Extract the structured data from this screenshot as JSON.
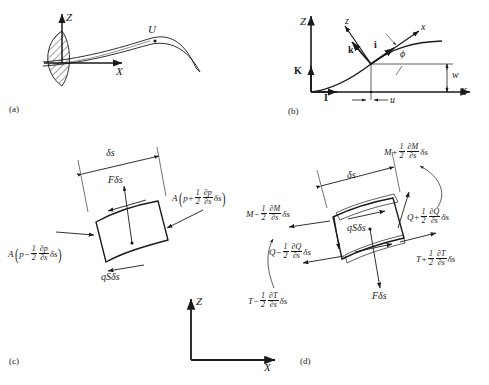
{
  "figure": {
    "type": "engineering-diagram",
    "panels": [
      {
        "tag": "(a)",
        "name": "blade-geometry"
      },
      {
        "tag": "(b)",
        "name": "coordinate-systems"
      },
      {
        "tag": "(c)",
        "name": "pressure-element"
      },
      {
        "tag": "(d)",
        "name": "moment-shear-element"
      }
    ]
  },
  "panel_a": {
    "tag": "(a)",
    "axis_z": "Z",
    "axis_x": "X",
    "velocity": "U"
  },
  "panel_b": {
    "tag": "(b)",
    "axis_Z": "Z",
    "axis_X": "X",
    "unit_K": "K",
    "unit_I": "I",
    "unit_k": "k",
    "unit_i": "i",
    "local_z": "z",
    "local_x": "x",
    "angle_phi": "ϕ",
    "disp_w": "w",
    "disp_u": "u"
  },
  "panel_c": {
    "tag": "(c)",
    "ds": "δs",
    "force_F": "Fδs",
    "force_qS": "qSδs",
    "pressure_plus": {
      "prefix": "A",
      "open": "(",
      "var": "p",
      "sign": "+",
      "frac_num": "1",
      "frac_den": "2",
      "deriv_num": "∂p",
      "deriv_den": "∂s",
      "suffix": "δs",
      "close": ")"
    },
    "pressure_minus": {
      "prefix": "A",
      "open": "(",
      "var": "p",
      "sign": "−",
      "frac_num": "1",
      "frac_den": "2",
      "deriv_num": "∂p",
      "deriv_den": "∂s",
      "suffix": "δs",
      "close": ")"
    }
  },
  "panel_d": {
    "tag": "(d)",
    "ds": "δs",
    "force_F": "Fδs",
    "force_qS": "qSδs",
    "moment_plus": {
      "var": "M",
      "sign": "+",
      "frac_num": "1",
      "frac_den": "2",
      "deriv_num": "∂M",
      "deriv_den": "∂s",
      "suffix": "δs"
    },
    "moment_minus": {
      "var": "M",
      "sign": "−",
      "frac_num": "1",
      "frac_den": "2",
      "deriv_num": "∂M",
      "deriv_den": "∂s",
      "suffix": "δs"
    },
    "shear_plus": {
      "var": "Q",
      "sign": "+",
      "frac_num": "1",
      "frac_den": "2",
      "deriv_num": "∂Q",
      "deriv_den": "∂s",
      "suffix": "δs"
    },
    "shear_minus": {
      "var": "Q",
      "sign": "−",
      "frac_num": "1",
      "frac_den": "2",
      "deriv_num": "∂Q",
      "deriv_den": "∂s",
      "suffix": "δs"
    },
    "tension_plus": {
      "var": "T",
      "sign": "+",
      "frac_num": "1",
      "frac_den": "2",
      "deriv_num": "∂T",
      "deriv_den": "∂s",
      "suffix": "δs"
    },
    "tension_minus": {
      "var": "T",
      "sign": "−",
      "frac_num": "1",
      "frac_den": "2",
      "deriv_num": "∂T",
      "deriv_den": "∂s",
      "suffix": "δs"
    }
  },
  "shared_axes": {
    "axis_z": "Z",
    "axis_x": "X"
  },
  "colors": {
    "ink": "#1a1a1a",
    "background": "#ffffff"
  }
}
